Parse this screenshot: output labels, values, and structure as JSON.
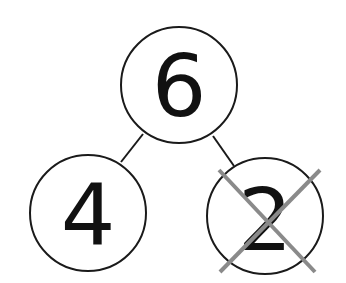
{
  "diagram": {
    "type": "number-bond",
    "whole": {
      "value": "6",
      "cx": 179,
      "cy": 85,
      "r": 58
    },
    "parts": [
      {
        "value": "4",
        "cx": 88,
        "cy": 213,
        "r": 58,
        "crossed_out": false
      },
      {
        "value": "2",
        "cx": 265,
        "cy": 216,
        "r": 58,
        "crossed_out": true
      }
    ],
    "colors": {
      "stroke": "#1a1a1a",
      "text": "#111111",
      "cross": "#8a8a8a",
      "background": "#ffffff"
    }
  }
}
